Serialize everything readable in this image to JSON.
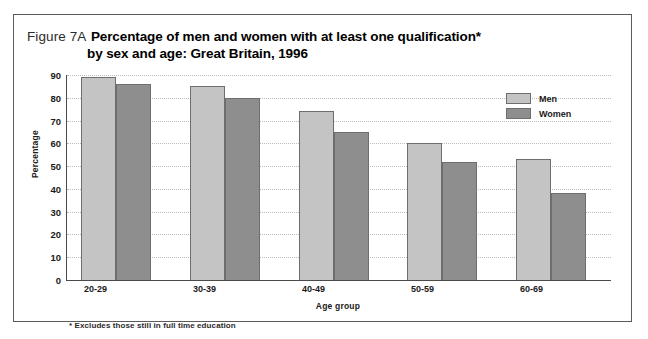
{
  "figure": {
    "number_label": "Figure 7A",
    "title_line1": "Percentage of men and women with at least one qualification*",
    "title_line2": "by sex and age: Great Britain, 1996",
    "footnote": "* Excludes those still in full time education"
  },
  "legend": {
    "position": "top-right",
    "entries": [
      {
        "label": "Men",
        "color": "#c4c4c4"
      },
      {
        "label": "Women",
        "color": "#8e8e8e"
      }
    ]
  },
  "axes": {
    "y_title": "Percentage",
    "x_title": "Age group",
    "y_ticks": [
      "0",
      "10",
      "20",
      "30",
      "40",
      "50",
      "60",
      "70",
      "80",
      "90"
    ]
  },
  "chart_data": {
    "type": "bar",
    "title": "Percentage of men and women with at least one qualification* by sex and age: Great Britain, 1996",
    "xlabel": "Age group",
    "ylabel": "Percentage",
    "ylim": [
      0,
      90
    ],
    "ytick_step": 10,
    "grid": true,
    "legend_position": "top-right",
    "categories": [
      "20-29",
      "30-39",
      "40-49",
      "50-59",
      "60-69"
    ],
    "series": [
      {
        "name": "Men",
        "color": "#c4c4c4",
        "values": [
          89,
          85,
          74,
          60,
          53
        ]
      },
      {
        "name": "Women",
        "color": "#8e8e8e",
        "values": [
          86,
          80,
          65,
          52,
          38
        ]
      }
    ]
  }
}
